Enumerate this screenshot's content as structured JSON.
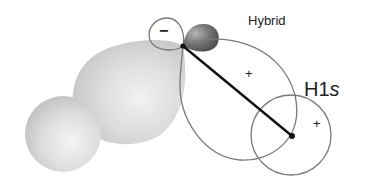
{
  "diagram": {
    "labels": {
      "hybrid": "Hybrid",
      "h1s_prefix": "H1",
      "h1s_suffix": "s"
    },
    "signs": {
      "minus_lobe": "−",
      "hybrid_lobe": "+",
      "h1s_orbital": "+"
    },
    "colors": {
      "outline": "#7a7a7a",
      "bond_line": "#111111",
      "electron_cloud": "#d6d6d6",
      "small_lobe_dark": "#6f6f6f"
    }
  }
}
